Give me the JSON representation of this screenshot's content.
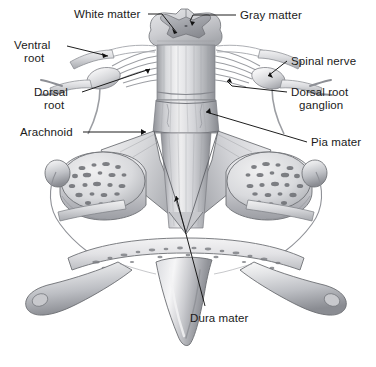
{
  "figure": {
    "background_color": "#ffffff",
    "style": "grayscale medical illustration",
    "labels": [
      {
        "id": "white-matter",
        "text": "White matter",
        "x": 74,
        "y": 8,
        "align": "left"
      },
      {
        "id": "gray-matter",
        "text": "Gray matter",
        "x": 240,
        "y": 9,
        "align": "left"
      },
      {
        "id": "ventral-root-1",
        "text": "Ventral",
        "x": 14,
        "y": 39,
        "align": "left"
      },
      {
        "id": "ventral-root-2",
        "text": "root",
        "x": 24,
        "y": 52,
        "align": "left"
      },
      {
        "id": "spinal-nerve",
        "text": "Spinal nerve",
        "x": 291,
        "y": 55,
        "align": "left"
      },
      {
        "id": "dorsal-root-1",
        "text": "Dorsal",
        "x": 34,
        "y": 86,
        "align": "left"
      },
      {
        "id": "dorsal-root-2",
        "text": "root",
        "x": 44,
        "y": 99,
        "align": "left"
      },
      {
        "id": "dorsal-root-gang-1",
        "text": "Dorsal root",
        "x": 291,
        "y": 86,
        "align": "left"
      },
      {
        "id": "dorsal-root-gang-2",
        "text": "ganglion",
        "x": 299,
        "y": 99,
        "align": "left"
      },
      {
        "id": "arachnoid",
        "text": "Arachnoid",
        "x": 20,
        "y": 126,
        "align": "left"
      },
      {
        "id": "pia-mater",
        "text": "Pia mater",
        "x": 311,
        "y": 136,
        "align": "left"
      },
      {
        "id": "dura-mater",
        "text": "Dura mater",
        "x": 190,
        "y": 312,
        "align": "left"
      }
    ],
    "colors": {
      "ink": "#1a1a1a",
      "bone_light": "#e9e9ea",
      "bone_mid": "#c2c3c6",
      "bone_dark": "#8e9095",
      "nerve_light": "#dcdde0",
      "nerve_mid": "#b0b2b7",
      "gray_matter": "#a9abb0",
      "white_matter": "#d8d9dc",
      "dura": "#cfd0d3",
      "shadow": "#6e7075"
    }
  }
}
